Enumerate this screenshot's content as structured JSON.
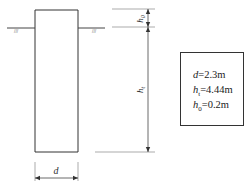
{
  "diagram": {
    "type": "pile cross-section with dimensions",
    "labels": {
      "top_dimension": {
        "symbol": "h",
        "subscript": "0"
      },
      "main_dimension": {
        "symbol": "h",
        "subscript": "t"
      },
      "width_dimension": {
        "symbol": "d"
      },
      "ground_symbol_left": "///",
      "ground_symbol_right": "///"
    },
    "parameters": [
      {
        "symbol": "d",
        "subscript": "",
        "value": "=2.3m"
      },
      {
        "symbol": "h",
        "subscript": "t",
        "value": "=4.44m"
      },
      {
        "symbol": "h",
        "subscript": "0",
        "value": "=0.2m"
      }
    ]
  }
}
